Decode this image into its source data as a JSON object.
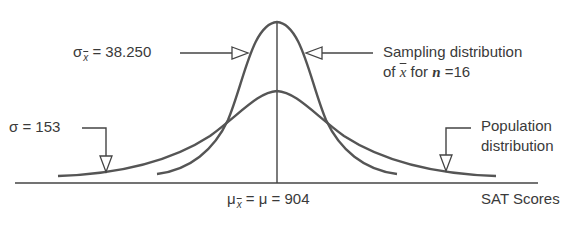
{
  "diagram": {
    "labels": {
      "sigma_xbar_symbol": "σ",
      "sigma_xbar_sub": "x",
      "sigma_xbar_value": " = 38.250",
      "sampling_line1": "Sampling distribution",
      "sampling_line2_pre": "of ",
      "sampling_line2_xbar": "x",
      "sampling_line2_mid": " for ",
      "sampling_line2_n": "n",
      "sampling_line2_post": " =16",
      "sigma_pop": "σ = 153",
      "population_line1": "Population",
      "population_line2": "distribution",
      "mu_symbol": "μ",
      "mu_sub": "x",
      "mu_rest": " = μ = 904",
      "x_axis": "SAT Scores"
    },
    "values": {
      "population_mean": 904,
      "population_sd": 153,
      "sample_size": 16,
      "sampling_sd": 38.25
    },
    "colors": {
      "curve": "#555555",
      "text": "#3a3a3a",
      "background": "#ffffff"
    }
  }
}
